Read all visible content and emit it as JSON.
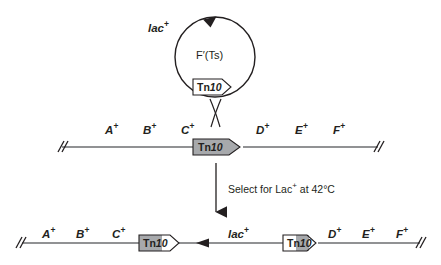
{
  "diagram": {
    "colors": {
      "line": "#6d6e71",
      "stroke": "#231f20",
      "element_fill_gray": "#a7a9ac",
      "element_fill_white": "#ffffff",
      "text": "#231f20"
    },
    "plasmid": {
      "name": "F′(Ts)",
      "marker": "lac",
      "marker_superscript": "+",
      "element_label_prefix": "Tn",
      "element_label_number": "10",
      "element_fill": "white",
      "direction_arrow": "clockwise"
    },
    "crossover": {
      "symbol": "X",
      "meaning": "homologous-recombination-crossover"
    },
    "chromosome_top": {
      "left_genes": [
        {
          "name": "A",
          "sup": "+"
        },
        {
          "name": "B",
          "sup": "+"
        },
        {
          "name": "C",
          "sup": "+"
        }
      ],
      "right_genes": [
        {
          "name": "D",
          "sup": "+"
        },
        {
          "name": "E",
          "sup": "+"
        },
        {
          "name": "F",
          "sup": "+"
        }
      ],
      "element_label_prefix": "Tn",
      "element_label_number": "10",
      "element_fill": "gray",
      "end_marks": "//"
    },
    "step": {
      "text_before": "Select for Lac",
      "superscript": "+",
      "text_after": " at 42°C",
      "full_text": "Select for Lac+ at 42°C",
      "arrow": "down-arrow"
    },
    "chromosome_bottom": {
      "left_genes": [
        {
          "name": "A",
          "sup": "+"
        },
        {
          "name": "B",
          "sup": "+"
        },
        {
          "name": "C",
          "sup": "+"
        }
      ],
      "right_genes": [
        {
          "name": "D",
          "sup": "+"
        },
        {
          "name": "E",
          "sup": "+"
        },
        {
          "name": "F",
          "sup": "+"
        }
      ],
      "middle_marker": "lac",
      "middle_marker_superscript": "+",
      "left_element": {
        "label_prefix": "Tn",
        "label_number": "10",
        "fill": "hybrid-gray-left"
      },
      "right_element": {
        "label_prefix": "Tn",
        "label_number": "10",
        "fill": "hybrid-gray-right"
      },
      "transfer_arrow": "left-arrow",
      "end_marks": "//"
    }
  }
}
